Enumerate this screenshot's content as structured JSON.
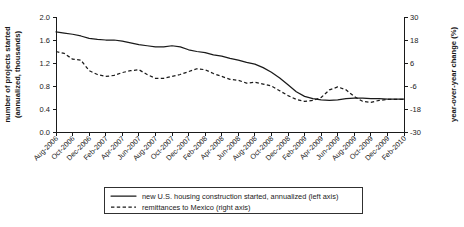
{
  "chart_data": {
    "type": "line",
    "title": "",
    "xlabel": "",
    "ylabel": "number of projects started\n(annualized, thousands)",
    "y2label": "year-over-year change (%)",
    "ylim": [
      0.0,
      2.0
    ],
    "y2lim": [
      -30,
      30
    ],
    "yticks": [
      "0.0",
      "0.4",
      "0.8",
      "1.2",
      "1.6",
      "2.0"
    ],
    "ytick_values": [
      0.0,
      0.4,
      0.8,
      1.2,
      1.6,
      2.0
    ],
    "y2ticks": [
      "-30",
      "-18",
      "-6",
      "6",
      "18",
      "30"
    ],
    "y2tick_values": [
      -30,
      -18,
      -6,
      6,
      18,
      30
    ],
    "grid": false,
    "legend_position": "below-center",
    "categories": [
      "Aug-2006",
      "Sep-2006",
      "Oct-2006",
      "Nov-2006",
      "Dec-2006",
      "Jan-2007",
      "Feb-2007",
      "Mar-2007",
      "Apr-2007",
      "May-2007",
      "Jun-2007",
      "Jul-2007",
      "Aug-2007",
      "Sep-2007",
      "Oct-2007",
      "Nov-2007",
      "Dec-2007",
      "Jan-2008",
      "Feb-2008",
      "Mar-2008",
      "Apr-2008",
      "May-2008",
      "Jun-2008",
      "Jul-2008",
      "Aug-2008",
      "Sep-2008",
      "Oct-2008",
      "Nov-2008",
      "Dec-2008",
      "Jan-2009",
      "Feb-2009",
      "Mar-2009",
      "Apr-2009",
      "May-2009",
      "Jun-2009",
      "Jul-2009",
      "Aug-2009",
      "Sep-2009",
      "Oct-2009",
      "Nov-2009",
      "Dec-2009",
      "Jan-2010",
      "Feb-2010"
    ],
    "xtick_labels": [
      "Aug-2006",
      "Oct-2006",
      "Dec-2006",
      "Feb-2007",
      "Apr-2007",
      "Jun-2007",
      "Aug-2007",
      "Oct-2007",
      "Dec-2007",
      "Feb-2008",
      "Apr-2008",
      "Jun-2008",
      "Aug-2008",
      "Oct-2008",
      "Dec-2008",
      "Feb-2009",
      "Apr-2009",
      "Jun-2009",
      "Aug-2009",
      "Oct-2009",
      "Dec-2009",
      "Feb-2010"
    ],
    "xtick_indices": [
      0,
      2,
      4,
      6,
      8,
      10,
      12,
      14,
      16,
      18,
      20,
      22,
      24,
      26,
      28,
      30,
      32,
      34,
      36,
      38,
      40,
      42
    ],
    "series": [
      {
        "name": "new U.S. housing construction started, annualized (left axis)",
        "axis": "left",
        "style": "solid",
        "units": "thousands (annualized)",
        "values": [
          1.74,
          1.72,
          1.7,
          1.67,
          1.63,
          1.61,
          1.6,
          1.6,
          1.58,
          1.55,
          1.52,
          1.5,
          1.48,
          1.48,
          1.5,
          1.48,
          1.43,
          1.4,
          1.38,
          1.34,
          1.32,
          1.28,
          1.25,
          1.21,
          1.18,
          1.12,
          1.04,
          0.94,
          0.82,
          0.7,
          0.62,
          0.58,
          0.56,
          0.55,
          0.56,
          0.58,
          0.59,
          0.59,
          0.58,
          0.58,
          0.57,
          0.57,
          0.57
        ]
      },
      {
        "name": "remittances to Mexico (right axis)",
        "axis": "right",
        "style": "dashed",
        "units": "percent year-over-year change",
        "values": [
          12.0,
          11.0,
          8.0,
          7.5,
          2.0,
          0.0,
          -1.0,
          -0.5,
          1.0,
          2.0,
          2.5,
          0.0,
          -2.0,
          -2.0,
          -1.0,
          0.0,
          1.5,
          3.0,
          2.5,
          0.5,
          -1.0,
          -2.5,
          -3.0,
          -4.5,
          -4.0,
          -5.0,
          -6.0,
          -8.5,
          -11.0,
          -13.0,
          -14.0,
          -13.5,
          -12.0,
          -8.0,
          -6.5,
          -8.0,
          -11.5,
          -14.0,
          -14.5,
          -13.5,
          -13.0,
          -13.0,
          -13.0
        ]
      }
    ],
    "legend_entries": [
      {
        "label": "new U.S. housing construction started, annualized (left axis)",
        "style": "solid"
      },
      {
        "label": "remittances to Mexico (right axis)",
        "style": "dashed"
      }
    ]
  }
}
